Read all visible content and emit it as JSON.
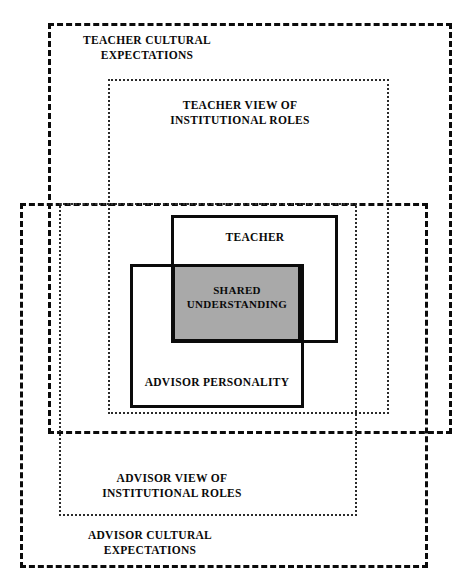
{
  "diagram": {
    "type": "nested-overlapping-rectangles",
    "colors": {
      "stroke": "#0b0b0b",
      "fine_stroke": "#2b2b2b",
      "shaded_fill": "#a9a9a9",
      "background": "#ffffff"
    },
    "regions": [
      {
        "id": "teacher-cultural-expectations",
        "label": "TEACHER CULTURAL\nEXPECTATIONS",
        "style": "dashed-heavy",
        "rect": {
          "x": 48,
          "y": 23,
          "w": 404,
          "h": 411
        }
      },
      {
        "id": "teacher-view-institutional-roles",
        "label": "TEACHER VIEW OF\nINSTITUTIONAL ROLES",
        "style": "dotted-fine",
        "rect": {
          "x": 108,
          "y": 79,
          "w": 281,
          "h": 335
        }
      },
      {
        "id": "teacher",
        "label": "TEACHER",
        "style": "solid-inner",
        "rect": {
          "x": 171,
          "y": 215,
          "w": 167,
          "h": 128
        }
      },
      {
        "id": "shared-understanding",
        "label": "SHARED\nUNDERSTANDING",
        "style": "shaded",
        "rect": {
          "x": 172,
          "y": 264,
          "w": 129,
          "h": 78
        }
      },
      {
        "id": "advisor-personality",
        "label": "ADVISOR PERSONALITY",
        "style": "solid-inner",
        "rect": {
          "x": 130,
          "y": 264,
          "w": 174,
          "h": 144
        }
      },
      {
        "id": "advisor-view-institutional-roles",
        "label": "ADVISOR VIEW OF\nINSTITUTIONAL ROLES",
        "style": "dotted-fine",
        "rect": {
          "x": 59,
          "y": 203,
          "w": 298,
          "h": 313
        }
      },
      {
        "id": "advisor-cultural-expectations",
        "label": "ADVISOR CULTURAL\nEXPECTATIONS",
        "style": "dashed-heavy",
        "rect": {
          "x": 20,
          "y": 203,
          "w": 408,
          "h": 365
        }
      }
    ],
    "labels": {
      "teacher_cultural_expectations": "TEACHER CULTURAL\nEXPECTATIONS",
      "teacher_view_institutional_roles": "TEACHER VIEW OF\nINSTITUTIONAL ROLES",
      "teacher": "TEACHER",
      "shared_understanding": "SHARED\nUNDERSTANDING",
      "advisor_personality": "ADVISOR PERSONALITY",
      "advisor_view_institutional_roles": "ADVISOR VIEW OF\nINSTITUTIONAL ROLES",
      "advisor_cultural_expectations": "ADVISOR CULTURAL\nEXPECTATIONS"
    }
  }
}
